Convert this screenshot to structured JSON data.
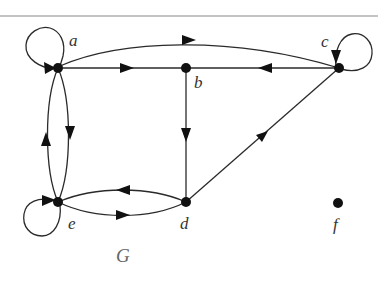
{
  "figure": {
    "graph_name": "G",
    "type": "directed graph",
    "vertices": [
      {
        "id": "a",
        "label": "a",
        "x": 58,
        "y": 68
      },
      {
        "id": "b",
        "label": "b",
        "x": 186,
        "y": 68
      },
      {
        "id": "c",
        "label": "c",
        "x": 339,
        "y": 68
      },
      {
        "id": "d",
        "label": "d",
        "x": 186,
        "y": 202
      },
      {
        "id": "e",
        "label": "e",
        "x": 58,
        "y": 202
      },
      {
        "id": "f",
        "label": "f",
        "x": 338,
        "y": 203
      }
    ],
    "edges": [
      {
        "from": "a",
        "to": "a",
        "kind": "loop"
      },
      {
        "from": "a",
        "to": "c",
        "kind": "curved"
      },
      {
        "from": "a",
        "to": "b",
        "kind": "straight"
      },
      {
        "from": "c",
        "to": "b",
        "kind": "straight"
      },
      {
        "from": "c",
        "to": "c",
        "kind": "loop"
      },
      {
        "from": "b",
        "to": "d",
        "kind": "straight"
      },
      {
        "from": "d",
        "to": "c",
        "kind": "straight"
      },
      {
        "from": "a",
        "to": "e",
        "kind": "curved"
      },
      {
        "from": "e",
        "to": "a",
        "kind": "curved"
      },
      {
        "from": "e",
        "to": "e",
        "kind": "loop"
      },
      {
        "from": "e",
        "to": "d",
        "kind": "curved"
      },
      {
        "from": "d",
        "to": "e",
        "kind": "curved"
      }
    ],
    "isolated_vertices": [
      "f"
    ],
    "colors": {
      "edge": "#2a2a2a",
      "node": "#111111",
      "rule": "#8a8a8a",
      "graph_label": "#666666"
    }
  }
}
